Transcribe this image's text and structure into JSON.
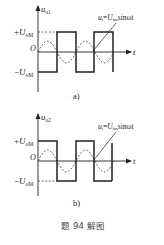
{
  "figure": {
    "caption": "题 94 解图",
    "colors": {
      "ink": "#222222",
      "dash": "#444444",
      "background": "#ffffff"
    }
  },
  "panels": [
    {
      "id": "a",
      "sublabel": "a)",
      "y_axis_label": "u",
      "y_axis_sub": "o1",
      "x_axis_label": "t",
      "origin_label": "O",
      "pos_level": {
        "sign": "+",
        "label": "U",
        "sub": "oM"
      },
      "neg_level": {
        "sign": "−",
        "label": "U",
        "sub": "oM"
      },
      "annotation": {
        "lhs": "u",
        "lhs_sub": "i",
        "eq": "=",
        "rhs": "U",
        "rhs_sub": "im",
        "func": "sinωt"
      }
    },
    {
      "id": "b",
      "sublabel": "b)",
      "y_axis_label": "u",
      "y_axis_sub": "o2",
      "x_axis_label": "t",
      "origin_label": "O",
      "pos_level": {
        "sign": "+",
        "label": "U",
        "sub": "oM"
      },
      "neg_level": {
        "sign": "−",
        "label": "U",
        "sub": "oM"
      },
      "annotation": {
        "lhs": "u",
        "lhs_sub": "i",
        "eq": "=",
        "rhs": "U",
        "rhs_sub": "im",
        "func": "sinωt"
      }
    }
  ]
}
